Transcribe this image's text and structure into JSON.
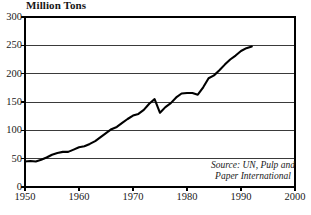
{
  "chart_data": {
    "type": "line",
    "title": "Million Tons",
    "xlabel": "",
    "ylabel": "Million Tons",
    "xlim": [
      1950,
      2000
    ],
    "ylim": [
      0,
      300
    ],
    "grid": true,
    "legend": null,
    "x_ticks": [
      "1950",
      "1960",
      "1970",
      "1980",
      "1990",
      "2000"
    ],
    "y_ticks": [
      "0",
      "50",
      "100",
      "150",
      "200",
      "250",
      "300"
    ],
    "annotation": {
      "line1": "Source: UN, Pulp and",
      "line2": "Paper International"
    },
    "series": [
      {
        "name": "World paper and paperboard production",
        "x": [
          1950,
          1951,
          1952,
          1953,
          1954,
          1955,
          1956,
          1957,
          1958,
          1959,
          1960,
          1961,
          1962,
          1963,
          1964,
          1965,
          1966,
          1967,
          1968,
          1969,
          1970,
          1971,
          1972,
          1973,
          1974,
          1975,
          1976,
          1977,
          1978,
          1979,
          1980,
          1981,
          1982,
          1983,
          1984,
          1985,
          1986,
          1987,
          1988,
          1989,
          1990,
          1991,
          1992
        ],
        "values": [
          45,
          46,
          45,
          48,
          52,
          57,
          60,
          62,
          62,
          66,
          70,
          72,
          76,
          81,
          88,
          95,
          102,
          106,
          113,
          120,
          126,
          129,
          136,
          147,
          155,
          131,
          141,
          148,
          158,
          165,
          166,
          166,
          163,
          176,
          192,
          197,
          206,
          216,
          225,
          232,
          240,
          245,
          248
        ]
      }
    ]
  },
  "axes": {
    "plot_left_px": 25,
    "plot_right_px": 295,
    "plot_top_px": 17,
    "plot_bottom_px": 187
  },
  "colors": {
    "line": "#000000",
    "frame": "#000000",
    "grid": "#3a3a3a",
    "background": "#ffffff",
    "text": "#1a1a1a"
  }
}
